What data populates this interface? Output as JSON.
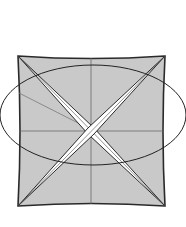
{
  "diagram": {
    "type": "origami-fold",
    "colors": {
      "paper": "#c9c9c9",
      "outline": "#2a2a2a",
      "crease": "#6b6b6b",
      "slit": "#ffffff",
      "ellipse": "#222222"
    },
    "square": {
      "x1": 18,
      "y1": 56,
      "x2": 165,
      "y2": 206
    },
    "center": {
      "x": 91,
      "y": 131
    },
    "ellipse": {
      "cx": 93,
      "cy": 115,
      "rx": 93,
      "ry": 50
    }
  }
}
